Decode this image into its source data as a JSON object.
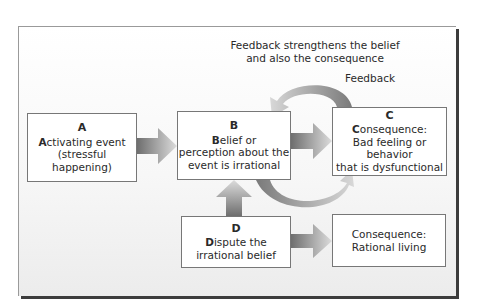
{
  "caption": {
    "line1": "Feedback strengthens the belief",
    "line2": "and also the consequence"
  },
  "feedback_label": "Feedback",
  "boxes": {
    "a": {
      "letter": "A",
      "lead": "A",
      "rest1": "ctivating event",
      "line2": "(stressful happening)"
    },
    "b": {
      "letter": "B",
      "lead": "B",
      "rest1": "elief or",
      "line2": "perception about the",
      "line3": "event is irrational"
    },
    "c": {
      "letter": "C",
      "lead": "C",
      "rest1": "onsequence:",
      "line2": "Bad feeling or behavior",
      "line3": "that is dysfunctional"
    },
    "d": {
      "letter": "D",
      "lead": "D",
      "rest1": "ispute the",
      "line2": "irrational belief"
    },
    "rational": {
      "line1": "Consequence:",
      "line2": "Rational living"
    }
  },
  "colors": {
    "arrow_dark": "#6e6e6e",
    "arrow_light": "#d8d8d8",
    "frame_shadow": "#3c3c3c"
  }
}
